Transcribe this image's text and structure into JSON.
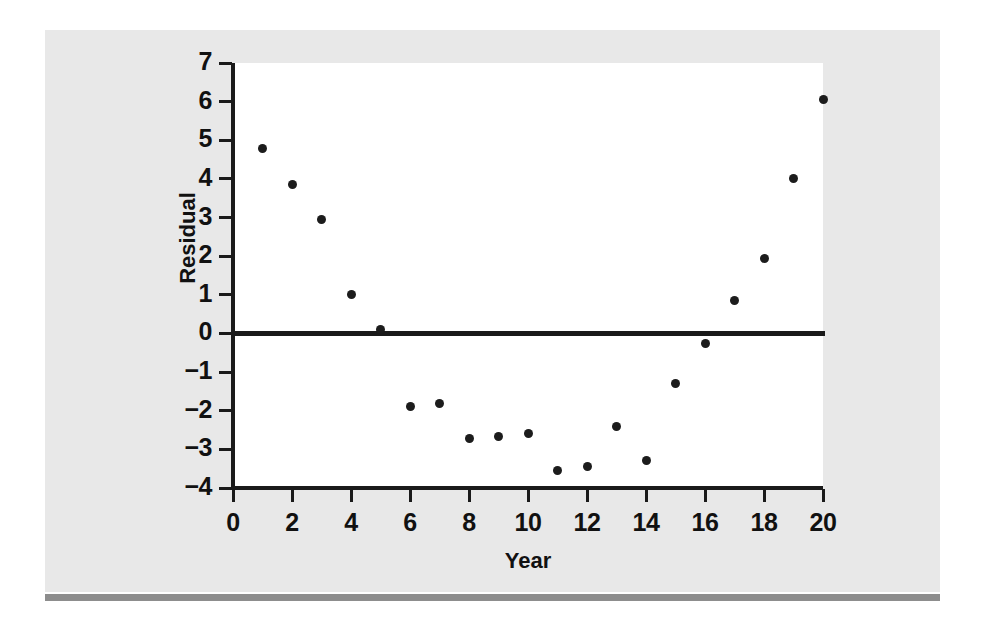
{
  "figure": {
    "background_color": "#e8e8e8",
    "plot_background_color": "#ffffff",
    "rule_color": "#8d8d8d",
    "ink_color": "#1a1a1a"
  },
  "chart_data": {
    "type": "scatter",
    "title": "",
    "xlabel": "Year",
    "ylabel": "Residual",
    "xlim": [
      0,
      20
    ],
    "ylim": [
      -4,
      7
    ],
    "xticks": [
      0,
      2,
      4,
      6,
      8,
      10,
      12,
      14,
      16,
      18,
      20
    ],
    "xtick_labels": [
      "0",
      "2",
      "4",
      "6",
      "8",
      "10",
      "12",
      "14",
      "16",
      "18",
      "20"
    ],
    "yticks": [
      -4,
      -3,
      -2,
      -1,
      0,
      1,
      2,
      3,
      4,
      5,
      6,
      7
    ],
    "ytick_labels": [
      "−4",
      "−3",
      "−2",
      "−1",
      "0",
      "1",
      "2",
      "3",
      "4",
      "5",
      "6",
      "7"
    ],
    "grid": false,
    "legend": null,
    "reference_line": {
      "type": "horizontal",
      "y": 0,
      "color": "#1a1a1a",
      "width_px": 5
    },
    "marker": {
      "shape": "circle",
      "color": "#1c1c1c",
      "size_px": 9
    },
    "x": [
      1,
      2,
      3,
      4,
      5,
      6,
      7,
      8,
      9,
      10,
      11,
      12,
      13,
      14,
      15,
      16,
      17,
      18,
      19,
      20
    ],
    "y": [
      4.8,
      3.85,
      2.95,
      1.0,
      0.1,
      -1.9,
      -1.82,
      -2.72,
      -2.66,
      -2.6,
      -3.55,
      -3.45,
      -2.4,
      -3.3,
      -1.3,
      -0.25,
      0.85,
      1.95,
      4.0,
      6.05
    ],
    "series": [
      {
        "name": "Residual",
        "points": [
          {
            "x": 1,
            "y": 4.8
          },
          {
            "x": 2,
            "y": 3.85
          },
          {
            "x": 3,
            "y": 2.95
          },
          {
            "x": 4,
            "y": 1.0
          },
          {
            "x": 5,
            "y": 0.1
          },
          {
            "x": 6,
            "y": -1.9
          },
          {
            "x": 7,
            "y": -1.82
          },
          {
            "x": 8,
            "y": -2.72
          },
          {
            "x": 9,
            "y": -2.66
          },
          {
            "x": 10,
            "y": -2.6
          },
          {
            "x": 11,
            "y": -3.55
          },
          {
            "x": 12,
            "y": -3.45
          },
          {
            "x": 13,
            "y": -2.4
          },
          {
            "x": 14,
            "y": -3.3
          },
          {
            "x": 15,
            "y": -1.3
          },
          {
            "x": 16,
            "y": -0.25
          },
          {
            "x": 17,
            "y": 0.85
          },
          {
            "x": 18,
            "y": 1.95
          },
          {
            "x": 19,
            "y": 4.0
          },
          {
            "x": 20,
            "y": 6.05
          }
        ]
      }
    ]
  }
}
